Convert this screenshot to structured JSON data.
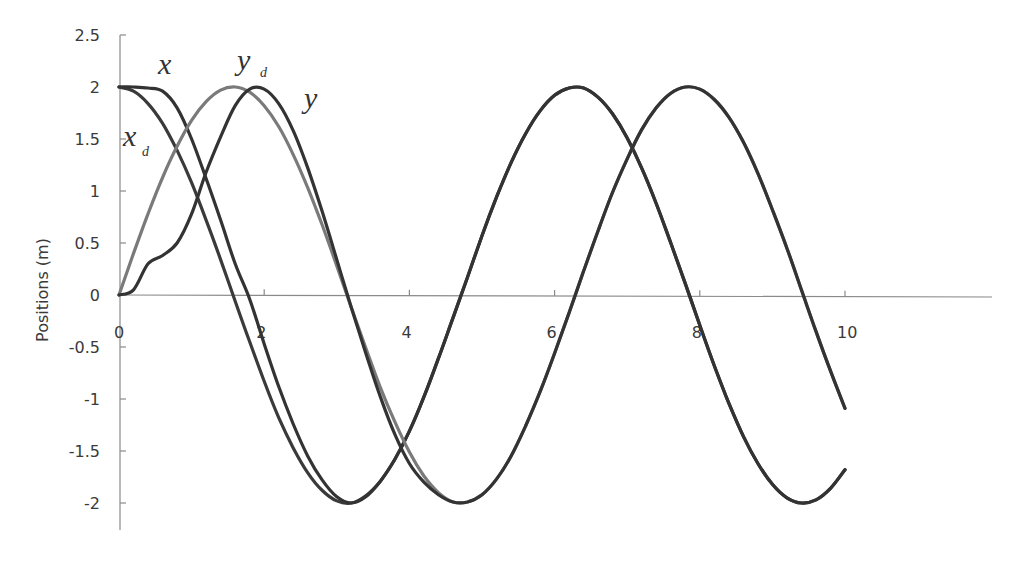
{
  "chart_data": {
    "type": "line",
    "title": "",
    "xlabel": "",
    "ylabel": "Positions (m)",
    "xlim": [
      0,
      12
    ],
    "ylim": [
      -2.5,
      2.5
    ],
    "grid": false,
    "legend": "inline curve labels",
    "x_ticks": [
      "0",
      "2",
      "4",
      "6",
      "8",
      "10"
    ],
    "y_ticks": [
      "2.5",
      "2",
      "1.5",
      "1",
      "0.5",
      "0",
      "-0.5",
      "-1",
      "-1.5",
      "-2"
    ],
    "x": [
      0,
      0.2,
      0.4,
      0.6,
      0.8,
      1.0,
      1.2,
      1.4,
      1.6,
      1.8,
      2.0,
      2.2,
      2.4,
      2.6,
      2.8,
      3.0,
      3.2,
      3.4,
      3.6,
      3.8,
      4.0,
      4.2,
      4.4,
      4.6,
      4.8,
      5.0,
      5.2,
      5.4,
      5.6,
      5.8,
      6.0,
      6.2,
      6.4,
      6.6,
      6.8,
      7.0,
      7.2,
      7.4,
      7.6,
      7.8,
      8.0,
      8.2,
      8.4,
      8.6,
      8.8,
      9.0,
      9.2,
      9.4,
      9.6,
      9.8,
      10.0
    ],
    "series": [
      {
        "name": "x_d",
        "label": "x",
        "subscript": "d",
        "color": "#3a3a3a",
        "values": [
          2,
          1.96,
          1.84,
          1.65,
          1.39,
          1.08,
          0.72,
          0.34,
          -0.06,
          -0.45,
          -0.83,
          -1.18,
          -1.47,
          -1.71,
          -1.88,
          -1.98,
          -2.0,
          -1.93,
          -1.79,
          -1.58,
          -1.31,
          -0.98,
          -0.61,
          -0.22,
          0.17,
          0.57,
          0.94,
          1.27,
          1.55,
          1.77,
          1.92,
          1.99,
          1.99,
          1.9,
          1.74,
          1.51,
          1.22,
          0.88,
          0.5,
          0.11,
          -0.29,
          -0.68,
          -1.04,
          -1.36,
          -1.62,
          -1.82,
          -1.95,
          -2.0,
          -1.97,
          -1.86,
          -1.68
        ]
      },
      {
        "name": "x",
        "label": "x",
        "subscript": "",
        "color": "#333333",
        "values": [
          2,
          2,
          1.99,
          1.96,
          1.8,
          1.5,
          1.12,
          0.72,
          0.3,
          -0.04,
          -0.47,
          -0.88,
          -1.24,
          -1.55,
          -1.78,
          -1.94,
          -2.0,
          -1.94,
          -1.79,
          -1.58,
          -1.31,
          -0.98,
          -0.61,
          -0.22,
          0.17,
          0.57,
          0.94,
          1.27,
          1.55,
          1.77,
          1.92,
          1.99,
          1.99,
          1.9,
          1.74,
          1.51,
          1.22,
          0.88,
          0.5,
          0.11,
          -0.29,
          -0.68,
          -1.04,
          -1.36,
          -1.62,
          -1.82,
          -1.95,
          -2.0,
          -1.97,
          -1.86,
          -1.68
        ]
      },
      {
        "name": "y_d",
        "label": "y",
        "subscript": "d",
        "color": "#7a7a7a",
        "values": [
          0,
          0.4,
          0.78,
          1.13,
          1.43,
          1.68,
          1.86,
          1.97,
          2.0,
          1.95,
          1.82,
          1.62,
          1.35,
          1.03,
          0.67,
          0.28,
          -0.12,
          -0.51,
          -0.89,
          -1.22,
          -1.51,
          -1.74,
          -1.9,
          -1.99,
          -1.99,
          -1.92,
          -1.77,
          -1.55,
          -1.26,
          -0.93,
          -0.56,
          -0.17,
          0.23,
          0.62,
          0.99,
          1.31,
          1.59,
          1.8,
          1.94,
          2.0,
          1.98,
          1.88,
          1.71,
          1.47,
          1.17,
          0.82,
          0.45,
          0.05,
          -0.35,
          -0.73,
          -1.09
        ]
      },
      {
        "name": "y",
        "label": "y",
        "subscript": "",
        "color": "#333333",
        "values": [
          0,
          0.05,
          0.3,
          0.38,
          0.5,
          0.78,
          1.18,
          1.52,
          1.82,
          1.98,
          1.98,
          1.84,
          1.58,
          1.22,
          0.8,
          0.34,
          -0.12,
          -0.56,
          -0.98,
          -1.34,
          -1.62,
          -1.8,
          -1.92,
          -1.99,
          -1.99,
          -1.92,
          -1.77,
          -1.55,
          -1.26,
          -0.93,
          -0.56,
          -0.17,
          0.23,
          0.62,
          0.99,
          1.31,
          1.59,
          1.8,
          1.94,
          2.0,
          1.98,
          1.88,
          1.71,
          1.47,
          1.17,
          0.82,
          0.45,
          0.05,
          -0.35,
          -0.73,
          -1.09
        ]
      }
    ],
    "annotations": [
      {
        "text": "x",
        "sub": "",
        "near": "x curve start, above"
      },
      {
        "text": "y",
        "sub": "d",
        "near": "y_d peak"
      },
      {
        "text": "y",
        "sub": "",
        "near": "y peak, right"
      },
      {
        "text": "x",
        "sub": "d",
        "near": "x_d descent, left"
      }
    ]
  },
  "labels": {
    "ylabel": "Positions (m)",
    "x": "x",
    "xd_main": "x",
    "xd_sub": "d",
    "yd_main": "y",
    "yd_sub": "d",
    "y": "y"
  }
}
